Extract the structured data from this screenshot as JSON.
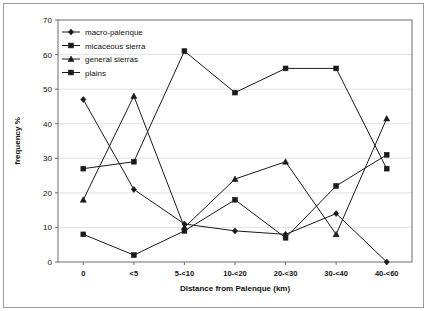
{
  "chart_data": {
    "type": "line",
    "title": "",
    "xlabel": "Distance from Palenque (km)",
    "ylabel": "frequency %",
    "categories": [
      "0",
      "<5",
      "5-<10",
      "10-<20",
      "20-<30",
      "30-<40",
      "40-<60"
    ],
    "ylim": [
      0,
      70
    ],
    "ytick_step": 10,
    "yticks": [
      "0",
      "10",
      "20",
      "30",
      "40",
      "50",
      "60",
      "70"
    ],
    "grid": true,
    "legend_position": "top-left",
    "series": [
      {
        "name": "macro-palenque",
        "marker": "diamond",
        "values": [
          47,
          21,
          11,
          9,
          8,
          14,
          0
        ]
      },
      {
        "name": "micaceous sierra",
        "marker": "square",
        "values": [
          8,
          2,
          9,
          18,
          7,
          22,
          31
        ]
      },
      {
        "name": "general sierras",
        "marker": "triangle",
        "values": [
          18,
          48,
          10,
          24,
          29,
          8,
          41.5
        ]
      },
      {
        "name": "plains",
        "marker": "square",
        "values": [
          27,
          29,
          61,
          49,
          56,
          56,
          27
        ]
      }
    ]
  },
  "colors": {
    "series": "#1a1a1a",
    "axis": "#6d6d6d",
    "grid": "#d9d9d9",
    "frame": "#9a9a9a",
    "background": "#ffffff"
  }
}
